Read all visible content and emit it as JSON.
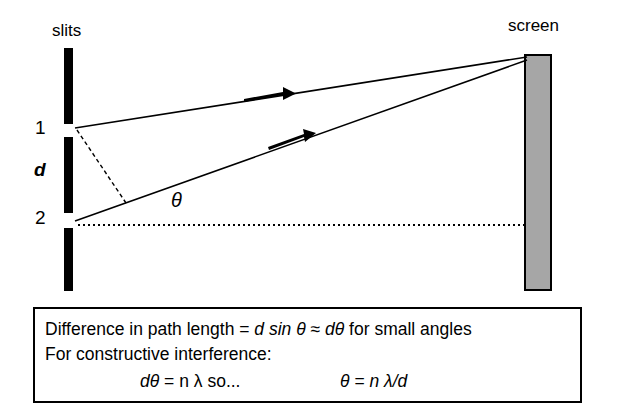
{
  "figure": {
    "type": "physics-diagram",
    "labels": {
      "slits": "slits",
      "screen": "screen",
      "slit_one": "1",
      "slit_spacing": "d",
      "slit_two": "2",
      "angle": "θ"
    },
    "colors": {
      "line": "#000000",
      "screen_fill": "#a6a6a6",
      "screen_border": "#000000",
      "background": "#ffffff"
    },
    "elements": {
      "barrier_segments": 3,
      "slit_count": 2,
      "ray_count": 2,
      "ray_arrow_markers": 2,
      "dashed_path_difference_line": true,
      "dotted_axis_line": true
    }
  },
  "formula_box": {
    "line1_pre": "Difference in path length = ",
    "line1_d": "d sin θ",
    "line1_approx": " ≈ ",
    "line1_dtheta": "dθ",
    "line1_post": " for small angles",
    "line2": "For constructive interference:",
    "line3_left": "dθ",
    "line3_left_eq": " = n λ",
    "line3_so": "  so...",
    "line3_right": "θ",
    "line3_right_eq": " = n λ/d"
  }
}
